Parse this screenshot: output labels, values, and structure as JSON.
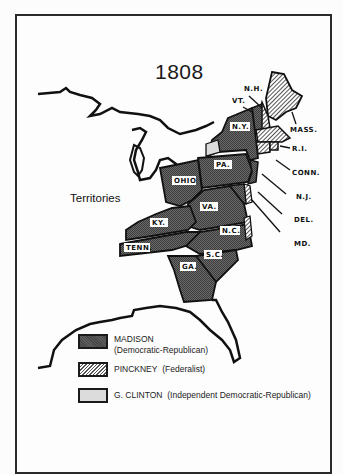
{
  "map": {
    "title": "1808",
    "region_label": "Territories",
    "state_labels": {
      "ny": "N.Y.",
      "pa": "PA.",
      "ohio": "OHIO",
      "va": "VA.",
      "ky": "KY.",
      "tenn": "TENN.",
      "nc": "N.C.",
      "sc": "S.C.",
      "ga": "GA."
    },
    "callouts": {
      "nh": "N.H.",
      "vt": "VT.",
      "mass": "MASS.",
      "ri": "R.I.",
      "conn": "CONN.",
      "nj": "N.J.",
      "del": "DEL.",
      "md": "MD."
    },
    "colors": {
      "madison": "#5e5e5e",
      "pinckney_hatch": "#555555",
      "clinton": "#dcdcdc",
      "outline": "#1a1a1a"
    }
  },
  "legend": {
    "items": [
      {
        "name": "MADISON",
        "party": "(Democratic-Republican)",
        "pattern": "dark-crosshatch"
      },
      {
        "name": "PINCKNEY",
        "party": "(Federalist)",
        "pattern": "diagonal-hatch"
      },
      {
        "name": "G. CLINTON",
        "party": "(Independent Democratic-Republican)",
        "pattern": "light-gray"
      }
    ]
  }
}
